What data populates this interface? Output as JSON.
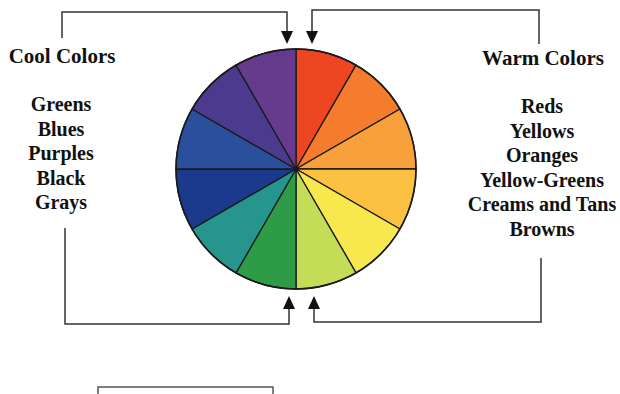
{
  "diagram": {
    "wheel": {
      "center": [
        296,
        169
      ],
      "radius": 120,
      "segments": [
        {
          "name": "red-orange",
          "color": "#EE4523"
        },
        {
          "name": "orange",
          "color": "#F47C2C"
        },
        {
          "name": "light-orange",
          "color": "#F8A03B"
        },
        {
          "name": "yellow-orange",
          "color": "#FCC140"
        },
        {
          "name": "yellow",
          "color": "#F7E84D"
        },
        {
          "name": "yellow-green",
          "color": "#C5DD56"
        },
        {
          "name": "green",
          "color": "#2E9C47"
        },
        {
          "name": "teal",
          "color": "#26958E"
        },
        {
          "name": "dark-blue",
          "color": "#1B3A8C"
        },
        {
          "name": "blue",
          "color": "#2A4F9C"
        },
        {
          "name": "blue-violet",
          "color": "#4C3A8E"
        },
        {
          "name": "purple",
          "color": "#663B8D"
        }
      ]
    },
    "cool": {
      "heading": "Cool Colors",
      "items": [
        "Greens",
        "Blues",
        "Purples",
        "Black",
        "Grays"
      ]
    },
    "warm": {
      "heading": "Warm Colors",
      "items": [
        "Reds",
        "Yellows",
        "Oranges",
        "Yellow-Greens",
        "Creams and Tans",
        "Browns"
      ]
    },
    "line_color": "#333333"
  }
}
